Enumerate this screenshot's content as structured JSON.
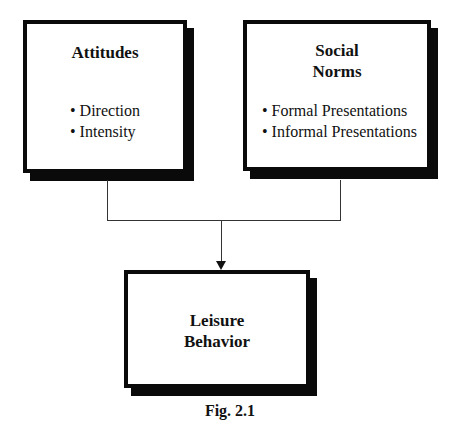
{
  "figure": {
    "caption": "Fig. 2.1",
    "boxes": {
      "attitudes": {
        "title_lines": [
          "Attitudes"
        ],
        "bullets": [
          "Direction",
          "Intensity"
        ]
      },
      "social_norms": {
        "title_lines": [
          "Social",
          "Norms"
        ],
        "bullets": [
          "Formal Presentations",
          "Informal Presentations"
        ]
      },
      "leisure_behavior": {
        "title_lines": [
          "Leisure",
          "Behavior"
        ],
        "bullets": []
      }
    },
    "connections": [
      {
        "from": "attitudes",
        "to": "leisure_behavior"
      },
      {
        "from": "social_norms",
        "to": "leisure_behavior"
      }
    ],
    "colors": {
      "border": "#0a0a0a",
      "background": "#ffffff",
      "line": "#333333"
    }
  }
}
